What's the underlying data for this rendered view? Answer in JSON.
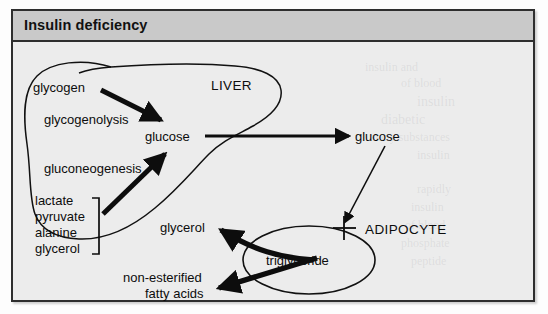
{
  "panel": {
    "title": "Insulin deficiency"
  },
  "colors": {
    "header_bg": "#c9c9c9",
    "panel_bg": "#ececec",
    "border": "#2e2e2e",
    "ink": "#0d0d0d"
  },
  "diagram": {
    "type": "pathway-diagram",
    "compartments": [
      {
        "id": "liver",
        "label": "LIVER",
        "shape": "irregular-blob"
      },
      {
        "id": "adipocyte",
        "label": "ADIPOCYTE",
        "shape": "ellipse"
      }
    ],
    "nodes": [
      {
        "id": "glycogen",
        "label": "glycogen",
        "compartment": "liver"
      },
      {
        "id": "glucose_liver",
        "label": "glucose",
        "compartment": "liver"
      },
      {
        "id": "glucose_blood",
        "label": "glucose",
        "compartment": "blood"
      },
      {
        "id": "substrates",
        "label": "lactate\npyruvate\nalanine\nglycerol",
        "compartment": "liver"
      },
      {
        "id": "glycerol_out",
        "label": "glycerol",
        "compartment": "blood"
      },
      {
        "id": "nefa",
        "label": "non-esterified\nfatty acids",
        "compartment": "blood"
      },
      {
        "id": "triglyceride",
        "label": "triglyceride",
        "compartment": "adipocyte"
      }
    ],
    "process_labels": [
      {
        "id": "glycogenolysis",
        "label": "glycogenolysis"
      },
      {
        "id": "gluconeogenesis",
        "label": "gluconeogenesis"
      }
    ],
    "substrate_list": [
      "lactate",
      "pyruvate",
      "alanine",
      "glycerol"
    ],
    "nefa_lines": [
      "non-esterified",
      "fatty acids"
    ],
    "edges": [
      {
        "from": "glycogen",
        "to": "glucose_liver",
        "weight": "thick",
        "via": "glycogenolysis"
      },
      {
        "from": "substrates",
        "to": "glucose_liver",
        "weight": "thick",
        "via": "gluconeogenesis"
      },
      {
        "from": "glucose_liver",
        "to": "glucose_blood",
        "weight": "medium"
      },
      {
        "from": "glucose_blood",
        "to": "adipocyte",
        "weight": "thin",
        "marker": "blocked-cross"
      },
      {
        "from": "triglyceride",
        "to": "glycerol_out",
        "weight": "thick"
      },
      {
        "from": "triglyceride",
        "to": "nefa",
        "weight": "thick"
      }
    ],
    "markers": [
      {
        "id": "uptake-block",
        "symbol": "cross",
        "meaning": "blocked-glucose-uptake"
      }
    ]
  },
  "bleed_through_text": [
    "insulin and",
    "of blood",
    "insulin",
    "diabetic",
    "many substances",
    "insulin",
    "rapidly",
    "insulin",
    "of blood",
    "phosphate",
    "peptide"
  ]
}
